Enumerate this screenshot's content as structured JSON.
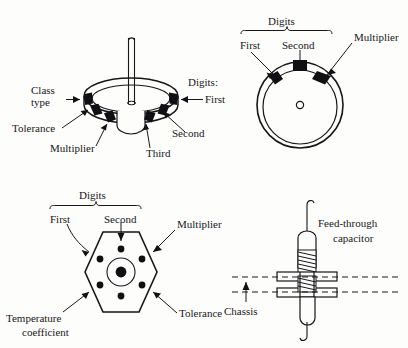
{
  "figure": {
    "background_color": "#fdfdfb",
    "ink_color": "#17171a",
    "band_fill_color": "#101014"
  },
  "panels": {
    "disc_perspective": {
      "name": "disc-capacitor-perspective",
      "labels": {
        "class_type_line1": "Class",
        "class_type_line2": "type",
        "tolerance": "Tolerance",
        "multiplier": "Multiplier",
        "third": "Third",
        "second": "Second",
        "first": "First",
        "digits": "Digits:"
      }
    },
    "disc_face": {
      "name": "disc-capacitor-face-view",
      "labels": {
        "digits": "Digits",
        "first": "First",
        "second": "Second",
        "multiplier": "Multiplier"
      }
    },
    "hexagon": {
      "name": "hexagonal-capacitor",
      "labels": {
        "digits": "Digits",
        "first": "First",
        "second": "Second",
        "multiplier": "Multiplier",
        "tolerance": "Tolerance",
        "temperature_line1": "Temperature",
        "temperature_line2": "coefficient"
      }
    },
    "feed_through": {
      "name": "feed-through-capacitor",
      "labels": {
        "title_line1": "Feed-through",
        "title_line2": "capacitor",
        "chassis": "Chassis"
      }
    }
  }
}
